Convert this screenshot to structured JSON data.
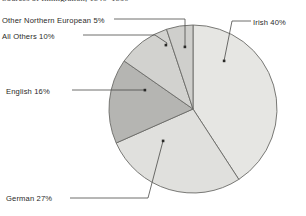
{
  "chart_data": {
    "type": "pie",
    "title": "Sources of Immigration, 1840–1860",
    "xlabel": "",
    "ylabel": "",
    "grid": false,
    "legend_position": "callout-labels",
    "start_angle_deg": 0,
    "direction": "clockwise",
    "categories": [
      "Irish",
      "German",
      "English",
      "All Others",
      "Other Northern European"
    ],
    "values": [
      40,
      27,
      16,
      10,
      5
    ],
    "unit": "%",
    "labels": [
      "Irish 40%",
      "German 27%",
      "English 16%",
      "All Others 10%",
      "Other Northern European  5%"
    ],
    "colors": [
      "#e6e6e3",
      "#e0e0dd",
      "#b5b5b2",
      "#d2d2cf",
      "#cfcfcc"
    ],
    "slice_border_color": "#6b6b68"
  },
  "chart": {
    "title": "Sources of Immigration, 1840–1860",
    "labels": {
      "irish": "Irish 40%",
      "german": "German 27%",
      "english": "English 16%",
      "all_others": "All Others 10%",
      "other_northern_european": "Other Northern European  5%"
    }
  },
  "style": {
    "background": "#ffffff",
    "text_color": "#2a2a28",
    "leader_line_color": "#4a4a48",
    "outline_color": "#6b6b68"
  }
}
